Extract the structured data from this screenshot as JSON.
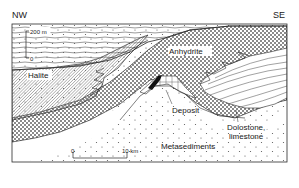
{
  "diagram": {
    "type": "geological-cross-section",
    "orientation": {
      "left": "NW",
      "right": "SE"
    },
    "units": [
      {
        "id": "overburden",
        "label": "",
        "pattern": "horizontal-wavy-lines"
      },
      {
        "id": "halite",
        "label": "Halite",
        "pattern": "diagonal-hatch"
      },
      {
        "id": "anhydrite",
        "label": "Anhydrite",
        "pattern": "checkered-crosshatch"
      },
      {
        "id": "dolostone",
        "label": "Dolostone, limestone",
        "label_line1": "Dolostone,",
        "label_line2": "limestone",
        "pattern": "thin-lenticular-layers"
      },
      {
        "id": "deposit",
        "label": "Deposit",
        "pattern": "solid-black"
      },
      {
        "id": "metasediments",
        "label": "Metasediments",
        "pattern": "dots"
      }
    ],
    "vertical_scale": {
      "top_label": "200 m",
      "bottom_label": "0"
    },
    "horizontal_scale": {
      "start_label": "0",
      "end_label": "10 km"
    },
    "colors": {
      "line": "#2a2a2a",
      "background": "#ffffff",
      "hatch": "#6a6a6a",
      "deposit": "#111111"
    }
  }
}
